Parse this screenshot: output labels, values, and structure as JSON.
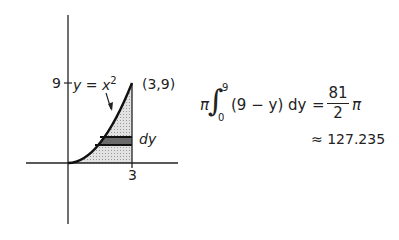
{
  "diagram": {
    "tick_label_y": "9",
    "curve_label": "y = x",
    "curve_label_exponent": "2",
    "point_label": "(3,9)",
    "tick_label_x": "3",
    "strip_label": "dy"
  },
  "formula": {
    "prefix": "π",
    "integral": "∫",
    "upper_limit": "9",
    "lower_limit": "0",
    "integrand": "(9 − y) dy",
    "equals": "=",
    "numerator": "81",
    "denominator": "2",
    "suffix": "π",
    "approx": "≈ 127.235"
  },
  "colors": {
    "shade": "#cfcfcf",
    "strip": "#555555",
    "line": "#111111"
  }
}
